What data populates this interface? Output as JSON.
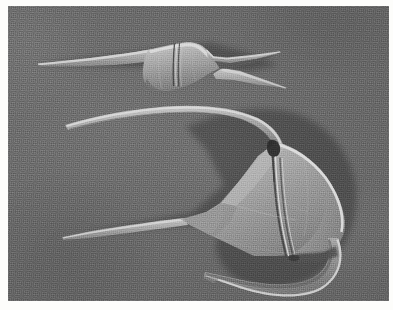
{
  "image": {
    "kind": "sem-micrograph",
    "subject": "two dinoflagellate cells (Ceratium-type thecae)",
    "width_px": 393,
    "height_px": 310,
    "border_style": "white photographic margin",
    "caption": "",
    "scale_bar_text": "",
    "magnification_text": "",
    "annotations": []
  },
  "colors": {
    "page_background": "#fdfdfb",
    "stub_background": "#6a6a6a",
    "stub_background_light": "#747474",
    "stub_background_dark": "#5d5d5d",
    "specimen_mid": "#a2a2a2",
    "specimen_light": "#c9c9c9",
    "specimen_highlight": "#e2e2e2",
    "specimen_shadow": "#4a4a4a",
    "groove_dark": "#3c3c3c"
  },
  "specimens": [
    {
      "id": "upper-cell",
      "label": "upper dinoflagellate",
      "orientation": "apical horn to the left, two antapical horns to the right",
      "approx_bbox": {
        "x": 28,
        "y": 36,
        "width": 248,
        "height": 62
      },
      "parts": [
        {
          "name": "apical-horn",
          "note": "long slender spine tapering to a point at far left"
        },
        {
          "name": "theca-body",
          "note": "fusiform central body"
        },
        {
          "name": "cingulum",
          "note": "transverse girdle groove, two fine parallel lines"
        },
        {
          "name": "left-antapical-horn",
          "note": "short upper-right spine"
        },
        {
          "name": "right-antapical-horn",
          "note": "longer lower-right spine"
        }
      ]
    },
    {
      "id": "lower-cell",
      "label": "lower dinoflagellate",
      "orientation": "curved apical horn sweeping up-left, hooked antapical horn curving down and left",
      "approx_bbox": {
        "x": 55,
        "y": 98,
        "width": 300,
        "height": 190
      },
      "parts": [
        {
          "name": "apical-horn",
          "note": "long curved horn sweeping left then tapering"
        },
        {
          "name": "theca-body",
          "note": "broad triangular-to-rounded epitheca and hypotheca"
        },
        {
          "name": "cingulum",
          "note": "girdle groove crossing the body as paired bright lines"
        },
        {
          "name": "sulcus-notch",
          "note": "dark depression at top of body where horn joins"
        },
        {
          "name": "left-antapical-horn",
          "note": "long straight slender spine pointing left"
        },
        {
          "name": "hooked-antapical-horn",
          "note": "stout strongly curved hook sweeping down and back to the left"
        }
      ]
    }
  ]
}
